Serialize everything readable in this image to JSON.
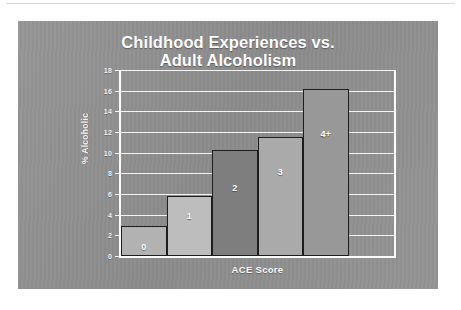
{
  "slide": {
    "background_color": "#919191"
  },
  "chart_data": {
    "type": "bar",
    "title": "Childhood Experiences vs.\nAdult Alcoholism",
    "title_line1": "Childhood Experiences vs.",
    "title_line2": "Adult Alcoholism",
    "xlabel": "ACE Score",
    "ylabel": "% Alcoholic",
    "categories": [
      "0",
      "1",
      "2",
      "3",
      "4+"
    ],
    "values": [
      2.9,
      5.8,
      10.3,
      11.5,
      16.2
    ],
    "bar_colors": [
      "#b2b2b2",
      "#bdbdbd",
      "#7e7e7e",
      "#aaaaaa",
      "#989898"
    ],
    "bar_label_inside": [
      true,
      true,
      true,
      true,
      false
    ],
    "ylim": [
      0,
      18
    ],
    "yticks": [
      0,
      2,
      4,
      6,
      8,
      10,
      12,
      14,
      16,
      18
    ],
    "ytick_labels": [
      "0",
      "2",
      "4",
      "6",
      "8",
      "10",
      "12",
      "14",
      "16",
      "18"
    ],
    "grid": true,
    "grid_color": "#f4f4f4",
    "axis_color": "#fbfbfb",
    "text_color": "#f5f5f5",
    "legend": null,
    "legend_position": "none",
    "series": [
      {
        "name": "% Alcoholic",
        "values": [
          2.9,
          5.8,
          10.3,
          11.5,
          16.2
        ]
      }
    ]
  }
}
